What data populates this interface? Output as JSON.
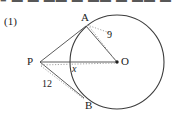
{
  "figure": {
    "item_number": "(1)",
    "cutoff_header_text": "■ ▬ ▬ ▬▬ ▬  ▬▬  ▬ ▬▬ ▬",
    "points": {
      "a": {
        "label": "A",
        "cx": 86,
        "cy": 26
      },
      "b": {
        "label": "B",
        "cx": 84,
        "cy": 98
      },
      "p": {
        "label": "P",
        "cx": 40,
        "cy": 62
      },
      "o": {
        "label": "O",
        "cx": 117,
        "cy": 62
      }
    },
    "circle": {
      "cx": 117,
      "cy": 62,
      "r": 47
    },
    "measurements": {
      "radius_oa": "9",
      "segment_px": "x",
      "segment_pb": "12"
    },
    "colors": {
      "stroke": "#3d3d3d",
      "dotted": "#8c8c8c",
      "text": "#1a1a1a",
      "background": "#ffffff"
    }
  }
}
